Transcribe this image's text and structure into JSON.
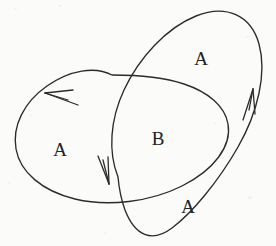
{
  "figure": {
    "width": 276,
    "height": 246,
    "background_color": "#fbfbf9",
    "ink_color": "#2b2b2b"
  },
  "labels": [
    {
      "id": "label-a-top",
      "text": "A",
      "x": 201,
      "y": 58,
      "region": "upper-right-curve-only"
    },
    {
      "id": "label-a-left",
      "text": "A",
      "x": 60,
      "y": 149,
      "region": "left-curve-only"
    },
    {
      "id": "label-b-center",
      "text": "B",
      "x": 158,
      "y": 138,
      "region": "intersection"
    },
    {
      "id": "label-a-bottom",
      "text": "A",
      "x": 188,
      "y": 206,
      "region": "lower-right-curve-only"
    }
  ],
  "curves": [
    {
      "id": "curve-left",
      "name": "left-ellipse",
      "orientation": "counter-clockwise",
      "path": "M 112 75 C 95 66, 70 70, 47 86 C 24 102, 12 126, 16 149 C 20 172, 42 191, 75 199 C 108 207, 150 202, 182 186 C 214 170, 232 146, 228 124 C 225 106, 208 92, 184 84 C 160 76, 134 75, 112 75 Z",
      "arrowheads": [
        {
          "id": "arrowhead-left",
          "tip_x": 45,
          "tip_y": 93,
          "direction": "down-left"
        }
      ]
    },
    {
      "id": "curve-right",
      "name": "right-ellipse",
      "orientation": "clockwise",
      "path": "M 118 177 C 108 152, 110 120, 124 90 C 139 58, 166 28, 196 16 C 226 4, 251 15, 259 44 C 267 73, 258 112, 238 147 C 218 182, 192 213, 172 228 C 152 243, 135 236, 125 210 C 121 199, 119 188, 118 177 Z",
      "arrowheads": [
        {
          "id": "arrowhead-right",
          "tip_x": 253,
          "tip_y": 89,
          "direction": "up-right"
        },
        {
          "id": "arrowhead-bottom",
          "tip_x": 109,
          "tip_y": 184,
          "direction": "down"
        }
      ]
    }
  ]
}
